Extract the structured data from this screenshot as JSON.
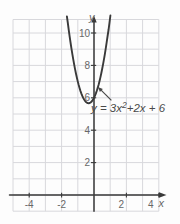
{
  "figure": {
    "background": "#fdfdfd",
    "grid_color": "#d8d8dc",
    "axis_color": "#3a3a3a",
    "curve_color": "#3a3a3a",
    "tick_label_color": "#686868",
    "annotation_color": "#4a4a4a"
  },
  "chart_data": {
    "type": "line",
    "title": "",
    "equation": "y = 3x² + 2x + 6",
    "function": {
      "form": "quadratic",
      "a": 3,
      "b": 2,
      "c": 6
    },
    "vertex": [
      -0.333,
      5.667
    ],
    "y_intercept": [
      0,
      6
    ],
    "x_range_drawn": [
      -1.67,
      1.01
    ],
    "xlabel": "x",
    "ylabel": "y",
    "x_ticks": [
      -4,
      -2,
      2,
      4
    ],
    "y_ticks": [
      2,
      4,
      6,
      8,
      10
    ],
    "xlim": [
      -5,
      4
    ],
    "ylim": [
      -1,
      10.8
    ],
    "grid": true,
    "annotation": {
      "pre": "y = 3x",
      "sup": "2",
      "post": "+2x + 6",
      "target_point": [
        0.24,
        6.67
      ]
    }
  }
}
